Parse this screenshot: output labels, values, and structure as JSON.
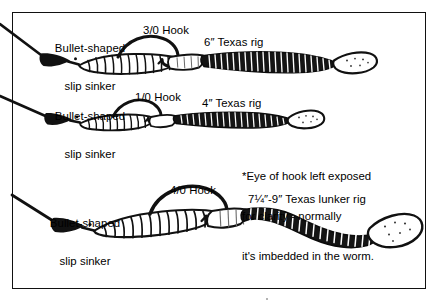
{
  "figure": {
    "kind": "fishing-rig-diagram",
    "background_color": "#ffffff",
    "ink_color": "#000000",
    "frame": {
      "present": true,
      "color": "#111111"
    }
  },
  "note": {
    "line1": "*Eye of hook left exposed",
    "line2": "for clarity - normally",
    "line3": "it's imbedded in the worm."
  },
  "rigs": [
    {
      "id": "rig-6in",
      "sinker_label_line1": "Bullet-shaped",
      "sinker_label_line2": "slip sinker",
      "hook_label": "3/0 Hook",
      "rig_label": "6″ Texas rig",
      "worm_length": "6″",
      "hook_size": "3/0"
    },
    {
      "id": "rig-4in",
      "sinker_label_line1": "Bullet-shaped",
      "sinker_label_line2": "slip sinker",
      "hook_label": "1/0 Hook",
      "rig_label": "4″ Texas rig",
      "worm_length": "4″",
      "hook_size": "1/0"
    },
    {
      "id": "rig-lunker",
      "sinker_label_line1": "Bullet-shaped",
      "sinker_label_line2": "slip sinker",
      "hook_label": "4/0 Hook",
      "rig_label": "7¼″-9″ Texas lunker rig",
      "worm_length": "7¼″-9″",
      "hook_size": "4/0"
    }
  ],
  "icons": {
    "sinker": "bullet-sinker-icon",
    "worm": "plastic-worm-icon",
    "hook": "fish-hook-icon",
    "line": "fishing-line-icon",
    "eye_marker": "hook-eye-asterisk-icon"
  }
}
